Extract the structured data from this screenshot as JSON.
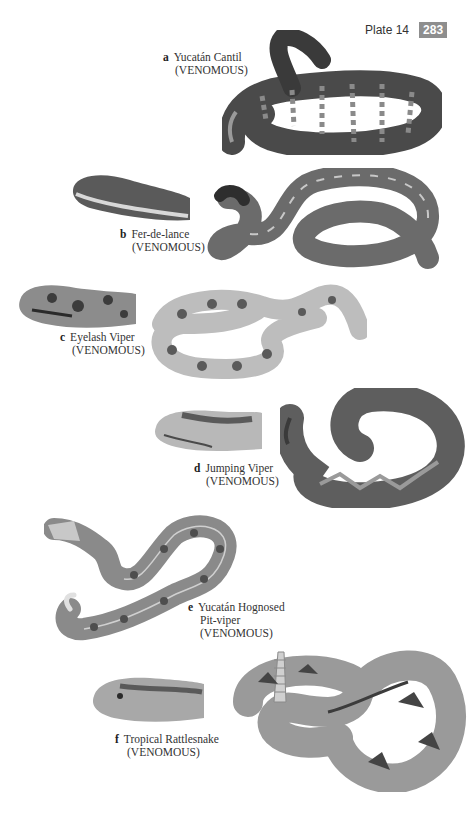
{
  "header": {
    "plate_label": "Plate 14",
    "page_number": "283"
  },
  "species": [
    {
      "letter": "a",
      "name": "Yucatán Cantil",
      "name_line2": "",
      "status": "(VENOMOUS)"
    },
    {
      "letter": "b",
      "name": "Fer-de-lance",
      "name_line2": "",
      "status": "(VENOMOUS)"
    },
    {
      "letter": "c",
      "name": "Eyelash Viper",
      "name_line2": "",
      "status": "(VENOMOUS)"
    },
    {
      "letter": "d",
      "name": "Jumping Viper",
      "name_line2": "",
      "status": "(VENOMOUS)"
    },
    {
      "letter": "e",
      "name": "Yucatán Hognosed",
      "name_line2": "Pit-viper",
      "status": "(VENOMOUS)"
    },
    {
      "letter": "f",
      "name": "Tropical Rattlesnake",
      "name_line2": "",
      "status": "(VENOMOUS)"
    }
  ],
  "colors": {
    "badge": "#8e8e8e",
    "cantil_body": "#4a4a4a",
    "ferdelance_body": "#6b6b6b",
    "eyelash_body": "#bdbdbd",
    "jumping_body": "#5e5e5e",
    "hognosed_body": "#8a8a8a",
    "rattlesnake_body": "#9a9a9a"
  }
}
